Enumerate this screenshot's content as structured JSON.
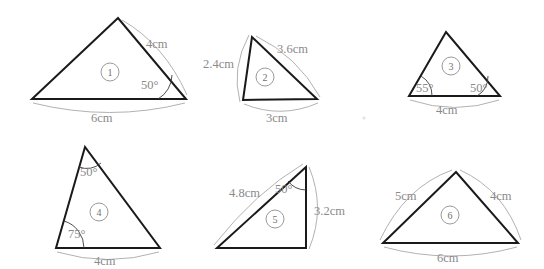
{
  "figure": {
    "background_color": "#ffffff",
    "edge_color": "#1a1a1a",
    "label_color": "#8a8a8a",
    "badge_color": "#6f6f6f",
    "brace_color": "#a8a8a8"
  },
  "triangles": [
    {
      "id": "1",
      "badge": "1",
      "labels": {
        "side_right": "4cm",
        "side_base": "6cm",
        "angle_right": "50°"
      }
    },
    {
      "id": "2",
      "badge": "2",
      "labels": {
        "side_left": "2.4cm",
        "side_right": "3.6cm",
        "side_base": "3cm"
      }
    },
    {
      "id": "3",
      "badge": "3",
      "labels": {
        "angle_left": "55°",
        "angle_right": "50°",
        "side_base": "4cm"
      }
    },
    {
      "id": "4",
      "badge": "4",
      "labels": {
        "angle_apex": "50°",
        "angle_left": "75°",
        "side_base": "4cm"
      }
    },
    {
      "id": "5",
      "badge": "5",
      "labels": {
        "side_hyp": "4.8cm",
        "angle_apex": "50°",
        "side_right": "3.2cm"
      }
    },
    {
      "id": "6",
      "badge": "6",
      "labels": {
        "side_left": "5cm",
        "side_right": "4cm",
        "side_base": "6cm"
      }
    }
  ]
}
